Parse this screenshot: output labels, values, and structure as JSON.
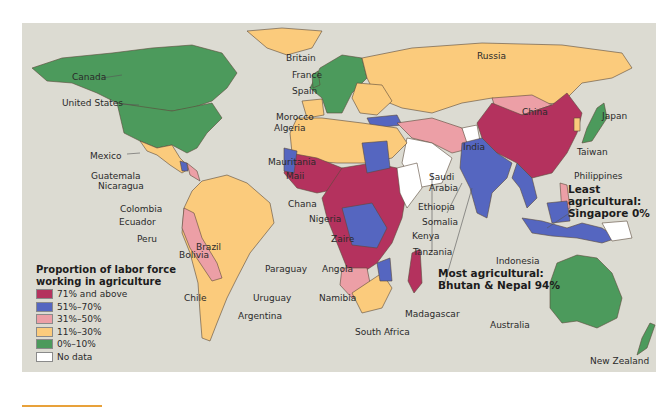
{
  "map": {
    "title": "Proportion of labor force working in agriculture",
    "legend": {
      "title_line1": "Proportion of labor force",
      "title_line2": "working in agriculture",
      "items": [
        {
          "label": "71% and above",
          "color": "#b4325e"
        },
        {
          "label": "51%–70%",
          "color": "#5566c0"
        },
        {
          "label": "31%–50%",
          "color": "#ec9fa6"
        },
        {
          "label": "11%–30%",
          "color": "#fbcb7c"
        },
        {
          "label": "0%–10%",
          "color": "#4c9a5c"
        },
        {
          "label": "No data",
          "color": "#ffffff"
        }
      ]
    },
    "ocean_color": "#dcdbd2",
    "country_labels": {
      "canada": "Canada",
      "united_states": "United States",
      "mexico": "Mexico",
      "guatemala": "Guatemala",
      "nicaragua": "Nicaragua",
      "colombia": "Colombia",
      "ecuador": "Ecuador",
      "peru": "Peru",
      "brazil": "Brazil",
      "bolivia": "Bolivia",
      "paraguay": "Paraguay",
      "chile": "Chile",
      "uruguay": "Uruguay",
      "argentina": "Argentina",
      "britain": "Britain",
      "france": "France",
      "spain": "Spain",
      "morocco": "Morocco",
      "algeria": "Algeria",
      "mauritania": "Mauritania",
      "mali": "Maii",
      "ghana": "Chana",
      "nigeria": "Nigeria",
      "zaire": "Zaire",
      "angola": "Angola",
      "namibia": "Namibia",
      "south_africa": "South Africa",
      "madagascar": "Madagascar",
      "tanzania": "Tanzania",
      "kenya": "Kenya",
      "somalia": "Somalia",
      "ethiopia": "Ethiopia",
      "saudi_arabia_1": "Saudi",
      "saudi_arabia_2": "Arabia",
      "russia": "Russia",
      "china": "China",
      "india": "India",
      "japan": "Japan",
      "taiwan": "Taiwan",
      "philippines": "Philippines",
      "indonesia": "Indonesia",
      "australia": "Australia",
      "new_zealand": "New Zealand"
    },
    "annotations": {
      "most_line1": "Most agricultural:",
      "most_line2": "Bhutan & Nepal 94%",
      "least_line1": "Least",
      "least_line2": "agricultural:",
      "least_line3": "Singapore 0%"
    }
  }
}
